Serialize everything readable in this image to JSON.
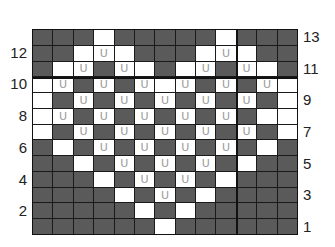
{
  "chart": {
    "title": "",
    "columns": 13,
    "rows": 13,
    "colors": {
      "dark": "#5a5a5a",
      "light": "#ffffff",
      "grid": "#1a1a1a",
      "symbol": "#9a9a9a"
    },
    "symbol": "U",
    "legend_note": "D = dark cell, W = white cell, U = white cell with U symbol",
    "grid_rows_top_to_bottom": [
      {
        "row": 13,
        "cells": [
          "D",
          "D",
          "D",
          "W",
          "D",
          "D",
          "D",
          "D",
          "D",
          "W",
          "D",
          "D",
          "D"
        ]
      },
      {
        "row": 12,
        "cells": [
          "D",
          "D",
          "W",
          "U",
          "W",
          "D",
          "D",
          "D",
          "W",
          "U",
          "W",
          "D",
          "D"
        ]
      },
      {
        "row": 11,
        "cells": [
          "D",
          "W",
          "U",
          "D",
          "U",
          "W",
          "D",
          "W",
          "U",
          "D",
          "U",
          "W",
          "D"
        ]
      },
      {
        "row": 10,
        "cells": [
          "W",
          "U",
          "D",
          "U",
          "D",
          "U",
          "W",
          "U",
          "D",
          "U",
          "D",
          "U",
          "W"
        ]
      },
      {
        "row": 9,
        "cells": [
          "W",
          "D",
          "U",
          "D",
          "U",
          "D",
          "U",
          "D",
          "U",
          "D",
          "U",
          "D",
          "W"
        ]
      },
      {
        "row": 8,
        "cells": [
          "W",
          "U",
          "D",
          "U",
          "D",
          "U",
          "D",
          "U",
          "D",
          "U",
          "D",
          "W",
          "W"
        ]
      },
      {
        "row": 7,
        "cells": [
          "W",
          "D",
          "U",
          "D",
          "U",
          "D",
          "U",
          "D",
          "U",
          "D",
          "U",
          "D",
          "W"
        ]
      },
      {
        "row": 6,
        "cells": [
          "D",
          "W",
          "D",
          "U",
          "D",
          "U",
          "D",
          "U",
          "D",
          "U",
          "D",
          "W",
          "D"
        ]
      },
      {
        "row": 5,
        "cells": [
          "D",
          "D",
          "W",
          "D",
          "U",
          "D",
          "U",
          "D",
          "U",
          "D",
          "W",
          "D",
          "D"
        ]
      },
      {
        "row": 4,
        "cells": [
          "D",
          "D",
          "D",
          "W",
          "D",
          "U",
          "D",
          "U",
          "D",
          "W",
          "D",
          "D",
          "D"
        ]
      },
      {
        "row": 3,
        "cells": [
          "D",
          "D",
          "D",
          "D",
          "W",
          "D",
          "U",
          "D",
          "W",
          "D",
          "D",
          "D",
          "D"
        ]
      },
      {
        "row": 2,
        "cells": [
          "D",
          "D",
          "D",
          "D",
          "D",
          "W",
          "D",
          "W",
          "D",
          "D",
          "D",
          "D",
          "D"
        ]
      },
      {
        "row": 1,
        "cells": [
          "D",
          "D",
          "D",
          "D",
          "D",
          "D",
          "W",
          "D",
          "D",
          "D",
          "D",
          "D",
          "D"
        ]
      }
    ],
    "left_labels": [
      "12",
      "10",
      "8",
      "6",
      "4",
      "2"
    ],
    "right_labels": [
      "13",
      "11",
      "9",
      "7",
      "5",
      "3",
      "1"
    ]
  }
}
